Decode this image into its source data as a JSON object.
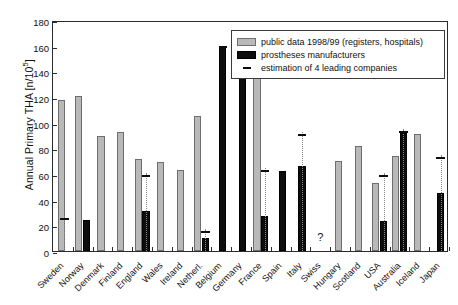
{
  "chart_data": {
    "type": "bar",
    "title": "",
    "xlabel": "",
    "ylabel": "Annual Primary THA [n/10⁵]",
    "ylabel_text": "Annual Primary THA [n/10",
    "ylabel_sup": "5",
    "ylabel_tail": "]",
    "ylim": [
      0,
      180
    ],
    "ytick_step": 20,
    "yticks": [
      "0",
      "20",
      "40",
      "60",
      "80",
      "100",
      "120",
      "140",
      "160",
      "180"
    ],
    "grid": false,
    "legend_position": "top-right",
    "categories": [
      "Sweden",
      "Norway",
      "Denmark",
      "Finland",
      "England",
      "Wales",
      "Ireland",
      "Netherl.",
      "Belgium",
      "Germany",
      "France",
      "Spain",
      "Italy",
      "Swiss",
      "Hungary",
      "Scotland",
      "USA",
      "Australia",
      "Iceland",
      "Japan"
    ],
    "series": [
      {
        "name": "public data 1998/99 (registers, hospitals)",
        "key": "public",
        "color": "#b9b9b9",
        "values": [
          118,
          121,
          90,
          93,
          72,
          69,
          63,
          105,
          null,
          null,
          136,
          null,
          null,
          null,
          70,
          82,
          53,
          74,
          91,
          null
        ]
      },
      {
        "name": "prostheses manufacturers",
        "key": "manufacturers",
        "color": "#0d0d0d",
        "values": [
          null,
          24,
          null,
          null,
          31,
          null,
          null,
          10,
          159,
          145,
          27,
          62,
          66,
          null,
          null,
          null,
          23,
          92,
          null,
          45
        ]
      },
      {
        "name": "estimation of 4 leading companies",
        "key": "estimation",
        "color": "#0d0d0d",
        "values": [
          27,
          null,
          null,
          null,
          61,
          null,
          null,
          17,
          161,
          null,
          65,
          null,
          93,
          null,
          null,
          null,
          61,
          95,
          null,
          75
        ]
      }
    ],
    "annotations": [
      {
        "category": "Swiss",
        "text": "?",
        "value": 8
      }
    ]
  },
  "legend": {
    "items": [
      {
        "label": "public data 1998/99 (registers, hospitals)",
        "swatch": "public"
      },
      {
        "label": "prostheses manufacturers",
        "swatch": "manu"
      },
      {
        "label": "estimation of 4 leading companies",
        "swatch": "dash"
      }
    ]
  }
}
